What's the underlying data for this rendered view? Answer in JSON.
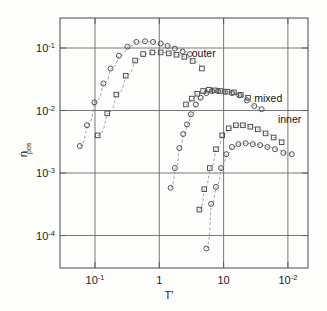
{
  "chart_data": {
    "type": "scatter",
    "title": "",
    "xlabel": "T'",
    "ylabel": "ṅpos",
    "ylabel_base": "n",
    "ylabel_sub": "pos",
    "xscale": "log",
    "yscale": "log",
    "xlim": [
      0.04,
      180
    ],
    "ylim": [
      4e-05,
      0.45
    ],
    "grid": true,
    "legend_position": "inline-annotations",
    "xticks": [
      0.1,
      1,
      10,
      100
    ],
    "xtick_labels": [
      "10-1",
      "1",
      "10",
      "10-2"
    ],
    "xtick_mantissa": [
      "10",
      "1",
      "10",
      "10"
    ],
    "xtick_exponent": [
      "-1",
      "",
      "",
      "-2"
    ],
    "yticks": [
      0.1,
      0.01,
      0.001,
      0.0001
    ],
    "ytick_labels": [
      "10-1",
      "10-2",
      "10-3",
      "10-4"
    ],
    "ytick_mantissa": [
      "10",
      "10",
      "10",
      "10"
    ],
    "ytick_exponent": [
      "-1",
      "-2",
      "-3",
      "-4"
    ],
    "annotations": [
      {
        "text": "outer",
        "x": 3.2,
        "y": 0.072
      },
      {
        "text": "mixed",
        "x": 30.0,
        "y": 0.0135
      },
      {
        "text": "inner",
        "x": 70.0,
        "y": 0.0062
      }
    ],
    "series": [
      {
        "name": "outer-circles",
        "group": "outer",
        "marker": "circle",
        "points": [
          {
            "x": 0.058,
            "y": 0.0027
          },
          {
            "x": 0.075,
            "y": 0.0058
          },
          {
            "x": 0.098,
            "y": 0.0135
          },
          {
            "x": 0.135,
            "y": 0.027
          },
          {
            "x": 0.175,
            "y": 0.047
          },
          {
            "x": 0.235,
            "y": 0.075
          },
          {
            "x": 0.32,
            "y": 0.105
          },
          {
            "x": 0.44,
            "y": 0.125
          },
          {
            "x": 0.6,
            "y": 0.128
          },
          {
            "x": 0.8,
            "y": 0.125
          },
          {
            "x": 1.05,
            "y": 0.118
          },
          {
            "x": 1.35,
            "y": 0.108
          },
          {
            "x": 1.75,
            "y": 0.098
          },
          {
            "x": 2.3,
            "y": 0.088
          },
          {
            "x": 3.0,
            "y": 0.08
          }
        ]
      },
      {
        "name": "outer-squares",
        "group": "outer",
        "marker": "square",
        "points": [
          {
            "x": 0.11,
            "y": 0.004
          },
          {
            "x": 0.155,
            "y": 0.009
          },
          {
            "x": 0.215,
            "y": 0.018
          },
          {
            "x": 0.3,
            "y": 0.036
          },
          {
            "x": 0.42,
            "y": 0.063
          },
          {
            "x": 0.56,
            "y": 0.08
          },
          {
            "x": 0.78,
            "y": 0.085
          },
          {
            "x": 1.05,
            "y": 0.085
          },
          {
            "x": 1.4,
            "y": 0.082
          },
          {
            "x": 1.85,
            "y": 0.078
          },
          {
            "x": 2.45,
            "y": 0.072
          },
          {
            "x": 3.3,
            "y": 0.062
          },
          {
            "x": 4.6,
            "y": 0.047
          }
        ]
      },
      {
        "name": "mixed-circles",
        "group": "mixed",
        "marker": "circle",
        "points": [
          {
            "x": 1.5,
            "y": 0.00058
          },
          {
            "x": 1.75,
            "y": 0.0012
          },
          {
            "x": 2.05,
            "y": 0.0025
          },
          {
            "x": 2.35,
            "y": 0.0042
          },
          {
            "x": 2.7,
            "y": 0.006
          },
          {
            "x": 3.1,
            "y": 0.0087
          },
          {
            "x": 3.7,
            "y": 0.0125
          },
          {
            "x": 4.4,
            "y": 0.016
          },
          {
            "x": 5.4,
            "y": 0.019
          },
          {
            "x": 6.6,
            "y": 0.0205
          },
          {
            "x": 8.2,
            "y": 0.0205
          },
          {
            "x": 10.5,
            "y": 0.02
          },
          {
            "x": 13.5,
            "y": 0.019
          },
          {
            "x": 17.5,
            "y": 0.0175
          },
          {
            "x": 23.0,
            "y": 0.0145
          },
          {
            "x": 30.0,
            "y": 0.0118
          },
          {
            "x": 39.0,
            "y": 0.0105
          }
        ]
      },
      {
        "name": "mixed-squares",
        "group": "mixed",
        "marker": "square",
        "points": [
          {
            "x": 2.6,
            "y": 0.0125
          },
          {
            "x": 3.2,
            "y": 0.0155
          },
          {
            "x": 3.9,
            "y": 0.0185
          },
          {
            "x": 4.8,
            "y": 0.0205
          },
          {
            "x": 5.9,
            "y": 0.0215
          },
          {
            "x": 7.3,
            "y": 0.021
          },
          {
            "x": 9.0,
            "y": 0.0205
          },
          {
            "x": 11.5,
            "y": 0.02
          },
          {
            "x": 14.5,
            "y": 0.0195
          },
          {
            "x": 18.5,
            "y": 0.0178
          },
          {
            "x": 24.0,
            "y": 0.016
          }
        ]
      },
      {
        "name": "inner-squares",
        "group": "inner",
        "marker": "square",
        "points": [
          {
            "x": 4.2,
            "y": 0.00026
          },
          {
            "x": 5.0,
            "y": 0.00055
          },
          {
            "x": 6.1,
            "y": 0.0012
          },
          {
            "x": 7.6,
            "y": 0.0024
          },
          {
            "x": 9.5,
            "y": 0.004
          },
          {
            "x": 12.0,
            "y": 0.0052
          },
          {
            "x": 15.5,
            "y": 0.0058
          },
          {
            "x": 20.0,
            "y": 0.0058
          },
          {
            "x": 26.0,
            "y": 0.0055
          },
          {
            "x": 34.0,
            "y": 0.005
          },
          {
            "x": 45.0,
            "y": 0.0043
          },
          {
            "x": 60.0,
            "y": 0.0037
          },
          {
            "x": 80.0,
            "y": 0.0031
          }
        ]
      },
      {
        "name": "inner-circles",
        "group": "inner",
        "marker": "circle",
        "points": [
          {
            "x": 5.4,
            "y": 6.2e-05
          },
          {
            "x": 6.4,
            "y": 0.00032
          },
          {
            "x": 7.6,
            "y": 0.0006
          },
          {
            "x": 9.1,
            "y": 0.0012
          },
          {
            "x": 11.0,
            "y": 0.002
          },
          {
            "x": 13.5,
            "y": 0.0026
          },
          {
            "x": 17.0,
            "y": 0.0029
          },
          {
            "x": 22.0,
            "y": 0.003
          },
          {
            "x": 28.5,
            "y": 0.0029
          },
          {
            "x": 37.0,
            "y": 0.0028
          },
          {
            "x": 48.0,
            "y": 0.0026
          },
          {
            "x": 63.0,
            "y": 0.0024
          },
          {
            "x": 85.0,
            "y": 0.0021
          },
          {
            "x": 115.0,
            "y": 0.002
          }
        ]
      }
    ]
  },
  "figure": {
    "caption": ""
  }
}
